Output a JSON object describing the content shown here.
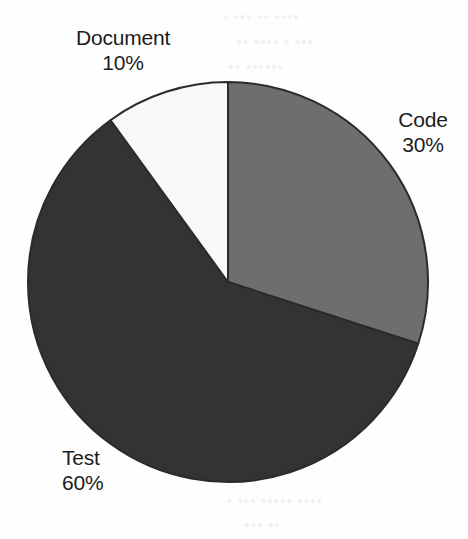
{
  "chart_data": {
    "type": "pie",
    "title": "",
    "categories": [
      "Code",
      "Test",
      "Document"
    ],
    "values": [
      30,
      60,
      10
    ],
    "unit": "%",
    "slices": [
      {
        "label": "Code",
        "value": 30,
        "value_text": "30%",
        "color": "#6e6e6e",
        "start_angle_deg": 0,
        "end_angle_deg": 108
      },
      {
        "label": "Test",
        "value": 60,
        "value_text": "60%",
        "color": "#333333",
        "start_angle_deg": 108,
        "end_angle_deg": 324
      },
      {
        "label": "Document",
        "value": 10,
        "value_text": "10%",
        "color": "#f8f8f8",
        "start_angle_deg": 324,
        "end_angle_deg": 360
      }
    ],
    "legend": "none",
    "labels_position": "outside",
    "start_angle_deg": 0,
    "direction": "clockwise",
    "grid": false,
    "outline_color": "#2b2b2b",
    "background_color": "#fefefe"
  },
  "labels": {
    "document": {
      "name": "Document",
      "value": "10%"
    },
    "code": {
      "name": "Code",
      "value": "30%"
    },
    "test": {
      "name": "Test",
      "value": "60%"
    }
  },
  "background_artifacts": {
    "note": "faint scanned bleed-through, illegible",
    "lines": [
      "• ••• •• ••••",
      "•• •••• • •••",
      "•• ••••••",
      "••• •• •••••",
      "••••• ••• ••",
      "•• •••• •••",
      "•••• •• ••••",
      "••• •••••",
      "•• •••• •••",
      "••••• •••",
      "• ••• ••••• ••••",
      "••• ••"
    ]
  }
}
